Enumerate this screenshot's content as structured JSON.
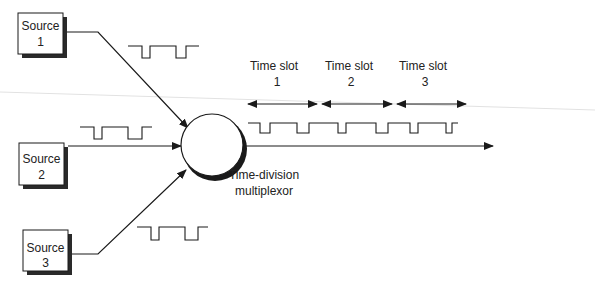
{
  "diagram": {
    "sources": [
      {
        "label_line1": "Source",
        "label_line2": "1"
      },
      {
        "label_line1": "Source",
        "label_line2": "2"
      },
      {
        "label_line1": "Source",
        "label_line2": "3"
      }
    ],
    "multiplexor": {
      "label_line1": "Time-division",
      "label_line2": "multiplexor"
    },
    "time_slots": [
      {
        "label_line1": "Time slot",
        "label_line2": "1"
      },
      {
        "label_line1": "Time slot",
        "label_line2": "2"
      },
      {
        "label_line1": "Time slot",
        "label_line2": "3"
      }
    ],
    "colors": {
      "stroke": "#1a1a1a",
      "shadow": "#2a2a2a",
      "background": "#ffffff",
      "faint_line": "#dcdcdc"
    }
  }
}
